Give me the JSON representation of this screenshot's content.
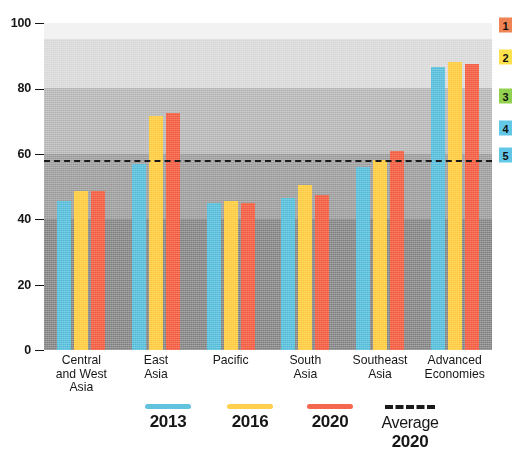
{
  "chart_data": {
    "type": "bar",
    "title": "",
    "subtitle": "",
    "xlabel": "",
    "ylabel": "",
    "ylim": [
      0,
      100
    ],
    "yticks": [
      0,
      20,
      40,
      60,
      80,
      100
    ],
    "ytick_labels": [
      "0",
      "20",
      "40",
      "60",
      "80",
      "100"
    ],
    "grid": false,
    "legend_position": "bottom",
    "categories": [
      "Central and West Asia",
      "East Asia",
      "Pacific",
      "South Asia",
      "Southeast Asia",
      "Advanced Economies"
    ],
    "category_lines": [
      [
        "Central",
        "and West",
        "Asia"
      ],
      [
        "East",
        "Asia"
      ],
      [
        "Pacific"
      ],
      [
        "South",
        "Asia"
      ],
      [
        "Southeast",
        "Asia"
      ],
      [
        "Advanced",
        "Economies"
      ]
    ],
    "series": [
      {
        "name": "2013",
        "color": "#63c2dd",
        "values": [
          45.5,
          57.0,
          45.0,
          46.5,
          56.0,
          86.5
        ]
      },
      {
        "name": "2016",
        "color": "#ffcf4d",
        "values": [
          48.5,
          71.5,
          45.5,
          50.5,
          58.0,
          88.0
        ]
      },
      {
        "name": "2020",
        "color": "#f4684f",
        "values": [
          48.5,
          72.5,
          45.0,
          47.5,
          61.0,
          87.5
        ]
      }
    ],
    "reference_line": {
      "label": "Average 2020",
      "value": 58.0,
      "style": "dashed",
      "color": "#1a1a1a"
    },
    "bands": [
      {
        "level": "1",
        "from": 0,
        "to": 40,
        "fill": "#8e8e8e",
        "badge_color": "#ef8354",
        "badge_at": 25
      },
      {
        "level": "2",
        "from": 40,
        "to": 60,
        "fill": "#a5a5a5",
        "badge_color": "#ffe14d",
        "badge_at": 57
      },
      {
        "level": "3",
        "from": 60,
        "to": 80,
        "fill": "#bdbdbd",
        "badge_color": "#92d14f",
        "badge_at": 96
      },
      {
        "level": "4",
        "from": 80,
        "to": 95,
        "fill": "#dcdcdc",
        "badge_color": "#63c8e8",
        "badge_at": 128
      },
      {
        "level": "5",
        "from": 95,
        "to": 100,
        "fill": "#f2f2f2",
        "badge_color": "#63c8e8",
        "badge_at": 155
      }
    ]
  },
  "legend": {
    "items": [
      {
        "label": "2013",
        "swatch": "line-solid-blue"
      },
      {
        "label": "2016",
        "swatch": "line-solid-yellow"
      },
      {
        "label": "2020",
        "swatch": "line-solid-orange"
      },
      {
        "label": "Average",
        "label2": "2020",
        "swatch": "line-dashed-black"
      }
    ]
  }
}
